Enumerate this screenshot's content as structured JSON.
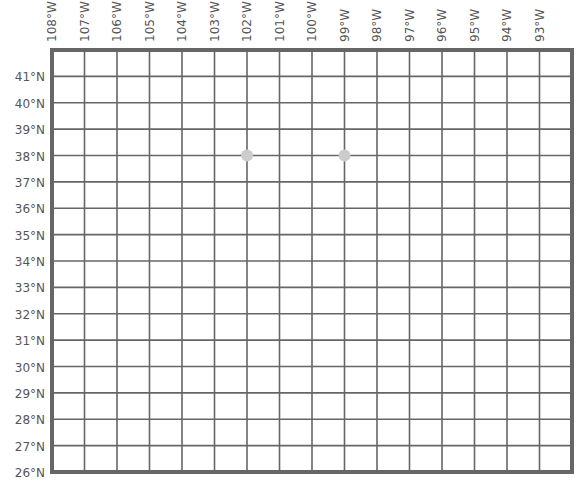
{
  "map": {
    "type": "lat-lon-grid",
    "longitude_labels": [
      "108°W",
      "107°W",
      "106°W",
      "105°W",
      "104°W",
      "103°W",
      "102°W",
      "101°W",
      "100°W",
      "99°W",
      "98°W",
      "97°W",
      "96°W",
      "95°W",
      "94°W",
      "93°W"
    ],
    "latitude_labels": [
      "41°N",
      "40°N",
      "39°N",
      "38°N",
      "37°N",
      "36°N",
      "35°N",
      "34°N",
      "33°N",
      "32°N",
      "31°N",
      "30°N",
      "29°N",
      "28°N",
      "27°N",
      "26°N"
    ],
    "lon_range": [
      -108,
      -92
    ],
    "lat_range": [
      26,
      42
    ],
    "points": [
      {
        "lat": 38,
        "lon": -102,
        "color": "#cccccc"
      },
      {
        "lat": 38,
        "lon": -99,
        "color": "#cccccc"
      }
    ],
    "colors": {
      "grid": "#666666",
      "border": "#666666",
      "point": "#cccccc",
      "label": "#555555"
    }
  }
}
